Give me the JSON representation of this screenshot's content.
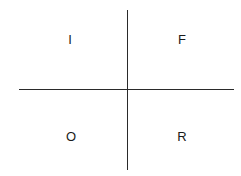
{
  "diagram": {
    "type": "quadrant",
    "quadrants": {
      "top_left": "I",
      "top_right": "F",
      "bottom_left": "O",
      "bottom_right": "R"
    },
    "colors": {
      "line": "#2a2a2a",
      "text": "#1a1a1a",
      "background": "#ffffff"
    }
  }
}
